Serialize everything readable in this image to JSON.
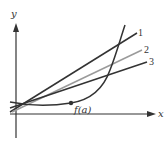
{
  "figure": {
    "axes": {
      "x_label": "x",
      "y_label": "y",
      "color": "#333333"
    },
    "lines": [
      {
        "label": "1",
        "color": "#333333",
        "from": [
          10,
          112
        ],
        "to": [
          137,
          33
        ]
      },
      {
        "label": "2",
        "color": "#9a9a9a",
        "from": [
          12,
          112
        ],
        "to": [
          142,
          50
        ]
      },
      {
        "label": "3",
        "color": "#333333",
        "from": [
          10,
          108
        ],
        "to": [
          147,
          62
        ]
      }
    ],
    "curve": {
      "name": "f",
      "color": "#333333"
    },
    "point": {
      "label": "f(a)",
      "x": 71,
      "y": 103
    }
  }
}
